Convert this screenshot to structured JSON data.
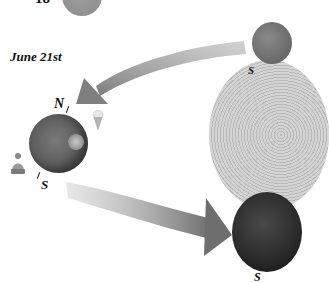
{
  "diagram": {
    "type": "seasonal-orbit-illustration",
    "top_number_label": "18",
    "date_label": "June 21st",
    "earth_poles": {
      "north": "N",
      "south": "S"
    },
    "right_planet_top_pole": "S",
    "bottom_planet_pole_partial": "S",
    "icons": [
      "winter-hat-icon",
      "ice-cream-icon"
    ],
    "colors": {
      "arrow": "#8c8c8c",
      "earth": "#5c5c5c",
      "sun": "#c8c8c8",
      "background": "#ffffff"
    }
  }
}
